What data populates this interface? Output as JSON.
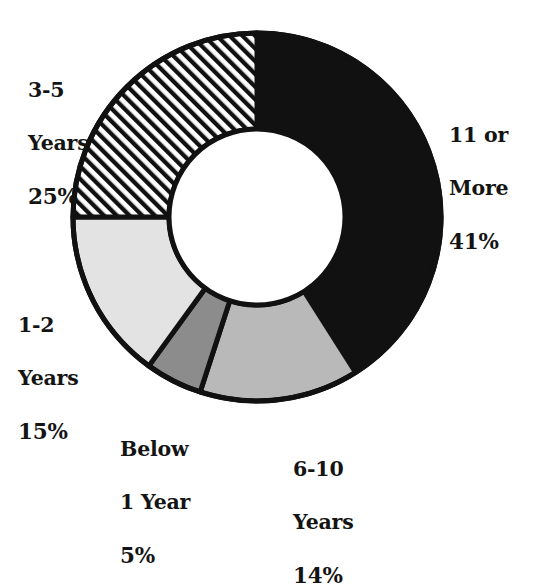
{
  "chart_data": {
    "type": "pie",
    "variant": "donut",
    "title": "",
    "subtitle": "",
    "xlabel": "",
    "ylabel": "",
    "legend_position": "none",
    "grid": false,
    "units": "percent",
    "total": 100,
    "start_angle_deg": 0,
    "direction": "clockwise",
    "categories": [
      "11 or More",
      "6-10 Years",
      "Below 1 Year",
      "1-2 Years",
      "3-5 Years"
    ],
    "values": [
      41,
      14,
      5,
      15,
      25
    ],
    "slices": [
      {
        "id": "11-or-more",
        "name": "11 or More",
        "name_line1": "11 or",
        "name_line2": "More",
        "value": 41,
        "value_label": "41%",
        "fill": "#111111",
        "pattern": "solid",
        "start_deg": 0,
        "end_deg": 147.6
      },
      {
        "id": "6-10-years",
        "name": "6-10 Years",
        "name_line1": "6-10",
        "name_line2": "Years",
        "value": 14,
        "value_label": "14%",
        "fill": "#b9b9b9",
        "pattern": "solid",
        "start_deg": 147.6,
        "end_deg": 198.0
      },
      {
        "id": "below-1-year",
        "name": "Below 1 Year",
        "name_line1": "Below",
        "name_line2": "1 Year",
        "value": 5,
        "value_label": "5%",
        "fill": "#8c8c8c",
        "pattern": "solid",
        "start_deg": 198.0,
        "end_deg": 216.0
      },
      {
        "id": "1-2-years",
        "name": "1-2 Years",
        "name_line1": "1-2",
        "name_line2": "Years",
        "value": 15,
        "value_label": "15%",
        "fill": "#e3e3e3",
        "pattern": "solid",
        "start_deg": 216.0,
        "end_deg": 270.0
      },
      {
        "id": "3-5-years",
        "name": "3-5 Years",
        "name_line1": "3-5",
        "name_line2": "Years",
        "value": 25,
        "value_label": "25%",
        "fill": "#ffffff",
        "pattern": "diagonal-hatch",
        "start_deg": 270.0,
        "end_deg": 360.0
      }
    ],
    "colors": {
      "stroke": "#111111",
      "background": "#ffffff",
      "text": "#141414",
      "hatch": "#111111"
    },
    "geometry": {
      "center_x": 257,
      "center_y": 217,
      "outer_radius": 184,
      "inner_radius": 88,
      "stroke_width": 5
    }
  },
  "labels": {
    "three_five": {
      "line1": "3-5",
      "line2": "Years",
      "value": "25%"
    },
    "eleven_more": {
      "line1": "11 or",
      "line2": "More",
      "value": "41%"
    },
    "one_two": {
      "line1": "1-2",
      "line2": "Years",
      "value": "15%"
    },
    "below_one": {
      "line1": "Below",
      "line2": "1 Year",
      "value": "5%"
    },
    "six_ten": {
      "line1": "6-10",
      "line2": "Years",
      "value": "14%"
    }
  }
}
